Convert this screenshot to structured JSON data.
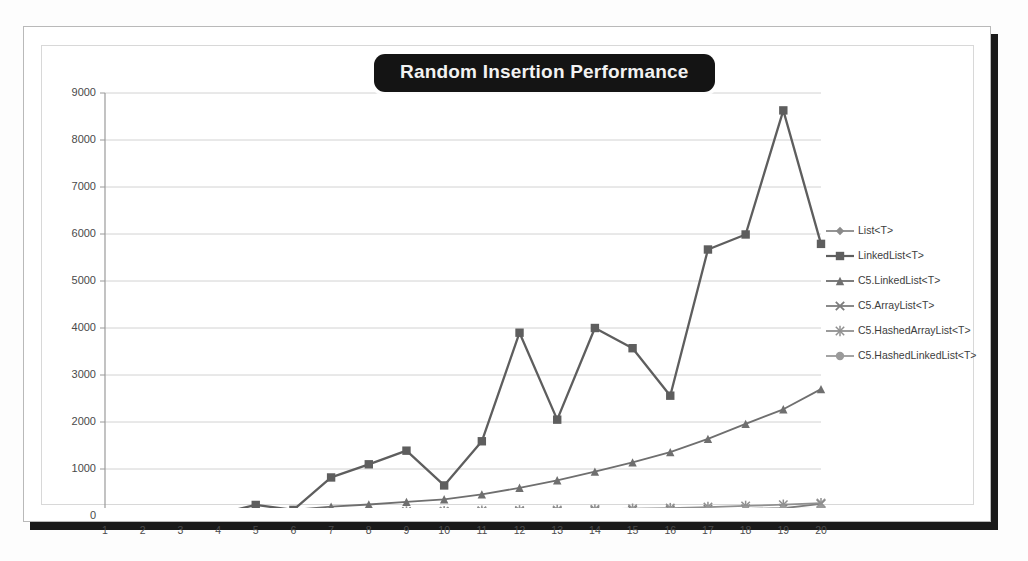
{
  "chart_data": {
    "type": "line",
    "title": "Random Insertion Performance",
    "xlabel": "",
    "ylabel": "",
    "x": [
      1,
      2,
      3,
      4,
      5,
      6,
      7,
      8,
      9,
      10,
      11,
      12,
      13,
      14,
      15,
      16,
      17,
      18,
      19,
      20
    ],
    "xlim": [
      1,
      20
    ],
    "ylim": [
      0,
      9000
    ],
    "ytick_values": [
      0,
      1000,
      2000,
      3000,
      4000,
      5000,
      6000,
      7000,
      8000,
      9000
    ],
    "ytick_labels": [
      "0",
      "1000",
      "2000",
      "3000",
      "4000",
      "5000",
      "6000",
      "7000",
      "8000",
      "9000"
    ],
    "xtick_labels": [
      "1",
      "2",
      "3",
      "4",
      "5",
      "6",
      "7",
      "8",
      "9",
      "10",
      "11",
      "12",
      "13",
      "14",
      "15",
      "16",
      "17",
      "18",
      "19",
      "20"
    ],
    "grid": true,
    "grid_axis": "y",
    "legend_position": "right",
    "series": [
      {
        "name": "List<T>",
        "color": "#8a8a8a",
        "marker": "diamond",
        "values": [
          10,
          12,
          20,
          22,
          45,
          40,
          60,
          75,
          95,
          100,
          105,
          108,
          112,
          120,
          128,
          132,
          140,
          150,
          158,
          150
        ]
      },
      {
        "name": "LinkedList<T>",
        "color": "#5e5e5e",
        "marker": "square",
        "values": [
          20,
          25,
          60,
          45,
          235,
          130,
          820,
          1100,
          1390,
          650,
          1590,
          3900,
          2050,
          4000,
          3570,
          2560,
          5670,
          5990,
          8630,
          5790
        ]
      },
      {
        "name": "C5.LinkedList<T>",
        "color": "#6f6f6f",
        "marker": "triangle",
        "values": [
          15,
          18,
          30,
          40,
          125,
          130,
          200,
          245,
          300,
          355,
          460,
          600,
          760,
          945,
          1140,
          1360,
          1640,
          1960,
          2270,
          2700
        ]
      },
      {
        "name": "C5.ArrayList<T>",
        "color": "#7d7d7d",
        "marker": "cross",
        "values": [
          8,
          10,
          15,
          18,
          35,
          38,
          55,
          70,
          88,
          95,
          100,
          105,
          110,
          118,
          125,
          130,
          140,
          152,
          165,
          260
        ]
      },
      {
        "name": "C5.HashedArrayList<T>",
        "color": "#909090",
        "marker": "star",
        "values": [
          9,
          11,
          16,
          20,
          40,
          42,
          62,
          78,
          96,
          104,
          112,
          120,
          130,
          142,
          155,
          168,
          190,
          215,
          240,
          275
        ]
      },
      {
        "name": "C5.HashedLinkedList<T>",
        "color": "#9a9a9a",
        "marker": "circle",
        "values": [
          7,
          9,
          14,
          16,
          30,
          32,
          48,
          60,
          75,
          82,
          88,
          92,
          96,
          102,
          108,
          112,
          120,
          130,
          140,
          150
        ]
      }
    ]
  },
  "legend": {
    "items": [
      {
        "label": "List<T>"
      },
      {
        "label": "LinkedList<T>"
      },
      {
        "label": "C5.LinkedList<T>"
      },
      {
        "label": "C5.ArrayList<T>"
      },
      {
        "label": "C5.HashedArrayList<T>"
      },
      {
        "label": "C5.HashedLinkedList<T>"
      }
    ]
  }
}
